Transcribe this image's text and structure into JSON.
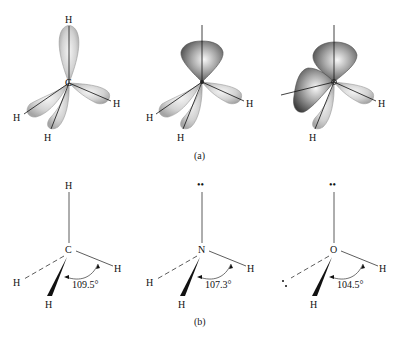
{
  "panel_a": {
    "caption": "(a)",
    "molecules": [
      {
        "name": "methane-orbitals",
        "center": "C",
        "labels": [
          "H",
          "H",
          "H",
          "H"
        ]
      },
      {
        "name": "ammonia-orbitals",
        "center": "N",
        "labels": [
          "H",
          "H",
          "H"
        ]
      },
      {
        "name": "water-orbitals",
        "center": "O",
        "labels": [
          "H",
          "H"
        ]
      }
    ]
  },
  "panel_b": {
    "caption": "(b)",
    "molecules": [
      {
        "name": "methane",
        "center": "C",
        "top": "H",
        "left": "H",
        "right": "H",
        "bottom": "H",
        "angle": "109.5°"
      },
      {
        "name": "ammonia",
        "center": "N",
        "top": "••",
        "left": "H",
        "right": "H",
        "bottom": "H",
        "angle": "107.3°"
      },
      {
        "name": "water",
        "center": "O",
        "top": "••",
        "left": "••",
        "right": "H",
        "bottom": "H",
        "angle": "104.5°"
      }
    ]
  },
  "colors": {
    "lobe_light": "#d8d8d8",
    "lobe_dark": "#6a6a6a",
    "line": "#111111"
  }
}
